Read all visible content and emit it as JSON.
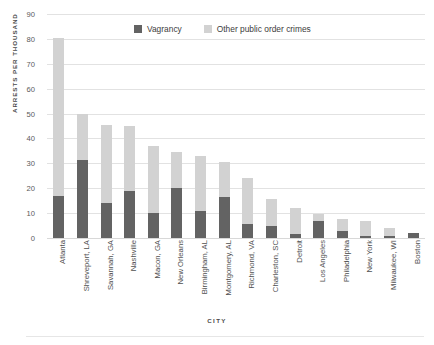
{
  "chart_data": {
    "type": "bar",
    "subtype": "stacked-vertical",
    "title": "",
    "xlabel": "CITY",
    "ylabel": "ARRESTS PER THOUSAND",
    "ylim": [
      0,
      90
    ],
    "yticks": [
      0,
      10,
      20,
      30,
      40,
      50,
      60,
      70,
      80,
      90
    ],
    "grid": true,
    "legend_position": "top-center",
    "categories": [
      "Atlanta",
      "Shreveport, LA",
      "Savannah, GA",
      "Nashville",
      "Macon, GA",
      "New Orleans",
      "Birmingham, AL",
      "Montgomery, AL",
      "Richmond, VA",
      "Charleston, SC",
      "Detroit",
      "Los Angeles",
      "Philadelphia",
      "New York",
      "Milwaukee, WI",
      "Boston"
    ],
    "series": [
      {
        "name": "Vagrancy",
        "color": "#636363",
        "values": [
          17,
          31.5,
          14,
          19,
          10,
          20,
          11,
          16.5,
          5.5,
          5,
          1.5,
          7,
          3,
          1,
          0.8,
          2
        ]
      },
      {
        "name": "Other public order crimes",
        "color": "#d2d2d2",
        "values": [
          63.5,
          18.5,
          31.5,
          26,
          27,
          14.5,
          22,
          14,
          18.5,
          10.5,
          10.5,
          2.8,
          4.5,
          6,
          3.2,
          0
        ]
      }
    ],
    "totals": [
      80.5,
      50,
      45.5,
      45,
      37,
      34.5,
      33,
      30.5,
      24,
      15.5,
      12,
      9.8,
      7.5,
      7,
      4,
      2
    ]
  },
  "legend": {
    "items": [
      {
        "label": "Vagrancy",
        "swatch": "legend-swatch-vagrancy"
      },
      {
        "label": "Other public order crimes",
        "swatch": "legend-swatch-other"
      }
    ]
  },
  "colors": {
    "vagrancy": "#636363",
    "other": "#d2d2d2",
    "gridline": "#e2e2e2",
    "text": "#4a4a4a",
    "background": "#ffffff"
  }
}
